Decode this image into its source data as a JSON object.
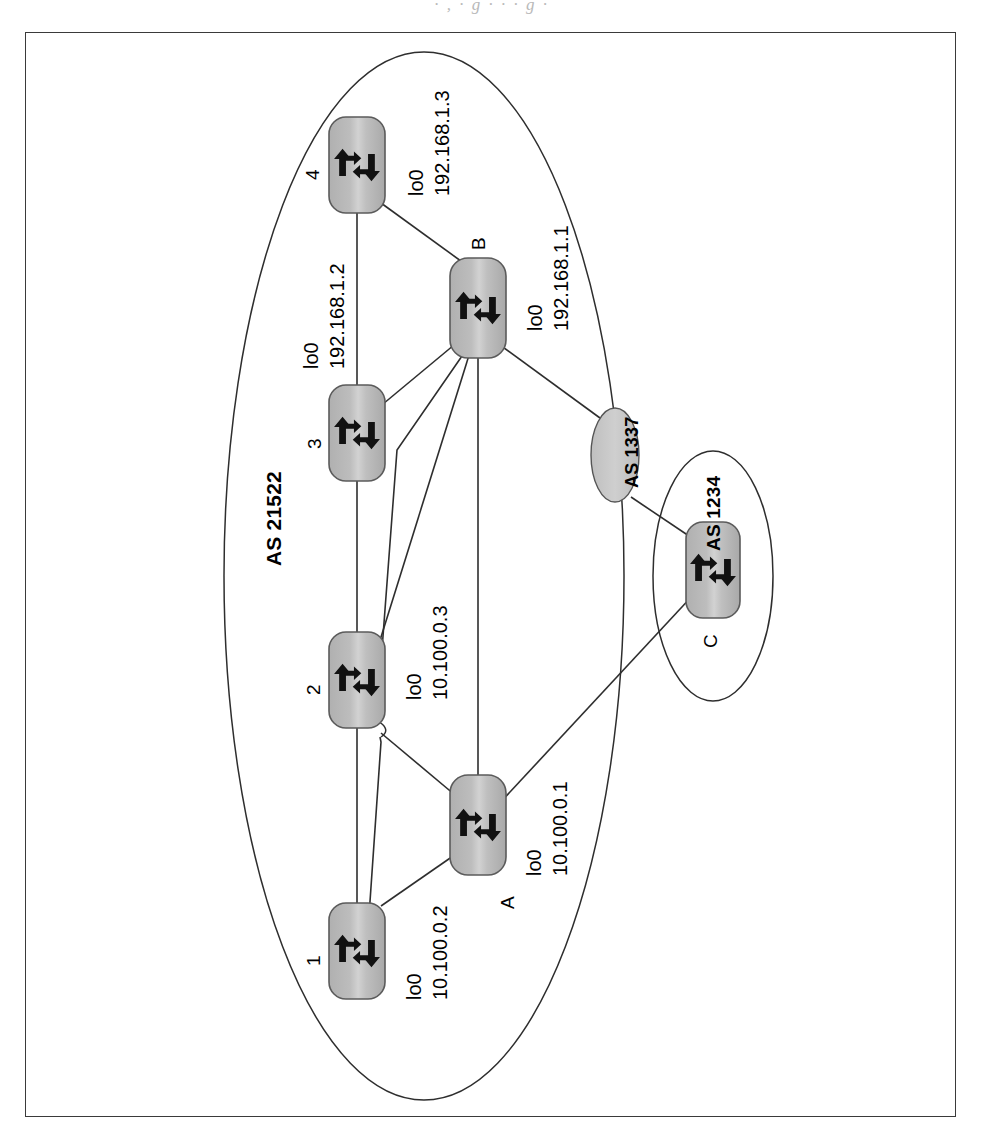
{
  "figure": {
    "type": "network-topology-diagram",
    "orientation": "rotated-90-ccw",
    "caption_sliver": "· , ·  g  ·      ·      ·   g ·",
    "domains": [
      {
        "id": "as21522",
        "label": "AS 21522",
        "shape": "ellipse",
        "style": "outline"
      },
      {
        "id": "as1234",
        "label": "AS 1234",
        "shape": "ellipse",
        "style": "outline"
      }
    ],
    "clouds": [
      {
        "id": "as1337",
        "label": "AS 1337",
        "shape": "ellipse",
        "style": "filled-gray"
      }
    ],
    "routers": [
      {
        "id": "r4",
        "name": "4",
        "iface": "lo0",
        "address": "192.168.1.3",
        "domain": "as21522"
      },
      {
        "id": "rB",
        "name": "B",
        "iface": "lo0",
        "address": "192.168.1.1",
        "domain": "as21522"
      },
      {
        "id": "r3",
        "name": "3",
        "iface": "lo0",
        "address": "192.168.1.2",
        "domain": "as21522"
      },
      {
        "id": "r2",
        "name": "2",
        "iface": "lo0",
        "address": "10.100.0.3",
        "domain": "as21522"
      },
      {
        "id": "r1",
        "name": "1",
        "iface": "lo0",
        "address": "10.100.0.2",
        "domain": "as21522"
      },
      {
        "id": "rA",
        "name": "A",
        "iface": "lo0",
        "address": "10.100.0.1",
        "domain": "as21522"
      },
      {
        "id": "rC",
        "name": "C",
        "iface": "",
        "address": "",
        "domain": "as1234"
      }
    ],
    "links": [
      {
        "from": "r4",
        "to": "r3"
      },
      {
        "from": "r4",
        "to": "rB"
      },
      {
        "from": "r3",
        "to": "r2"
      },
      {
        "from": "r3",
        "to": "rB"
      },
      {
        "from": "r2",
        "to": "r1"
      },
      {
        "from": "r2",
        "to": "rB"
      },
      {
        "from": "r2",
        "to": "rA"
      },
      {
        "from": "r1",
        "to": "rB"
      },
      {
        "from": "r1",
        "to": "rA"
      },
      {
        "from": "rB",
        "to": "rA"
      },
      {
        "from": "rB",
        "to": "as1337"
      },
      {
        "from": "as1337",
        "to": "rC"
      },
      {
        "from": "rA",
        "to": "rC"
      }
    ],
    "colors": {
      "router_fill": "#b3b3b3",
      "router_fill_light": "#c9c9c9",
      "router_stroke": "#4d4d4d",
      "cloud_fill": "#c6c6c6",
      "line": "#2e2e2e",
      "frame": "#3a3a3a",
      "text": "#000000"
    }
  }
}
